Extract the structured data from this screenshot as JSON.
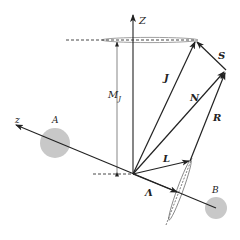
{
  "diagram": {
    "labels": {
      "Z_axis": "Z",
      "z_axis": "z",
      "nucleus_A": "A",
      "nucleus_B": "B",
      "J": "J",
      "N": "N",
      "S": "S",
      "R": "R",
      "L": "L",
      "Lambda": "Λ",
      "M_J_main": "M",
      "M_J_sub": "J"
    },
    "colors": {
      "line": "#222222",
      "nucleus_fill": "#c8c8c8",
      "ellipse_stroke": "#888888"
    },
    "vectors": [
      {
        "name": "J",
        "from": "origin",
        "to": "top of precession cone"
      },
      {
        "name": "N",
        "from": "origin",
        "to": "tip of R"
      },
      {
        "name": "S",
        "from": "tip of N",
        "to": "tip of J"
      },
      {
        "name": "R",
        "from": "tip of Lambda-cone",
        "to": "tip of N"
      },
      {
        "name": "L",
        "from": "origin",
        "to": "precession cone near z axis"
      },
      {
        "name": "Λ",
        "from": "origin",
        "to": "along internuclear axis z"
      }
    ]
  }
}
